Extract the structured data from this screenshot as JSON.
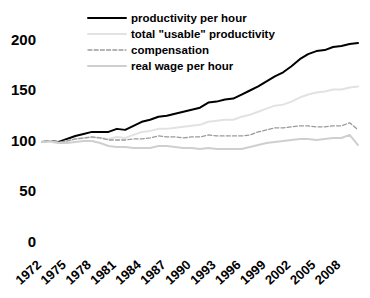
{
  "chart_data": {
    "type": "line",
    "title": "",
    "subtitle": "",
    "xlabel": "",
    "ylabel": "",
    "xlim": [
      1972,
      2010
    ],
    "ylim": [
      0,
      215
    ],
    "grid": false,
    "legend_position": "top-center",
    "y_ticks": [
      "0",
      "50",
      "100",
      "150",
      "200"
    ],
    "y_tick_values": [
      0,
      50,
      100,
      150,
      200
    ],
    "x_ticks": [
      "1972",
      "1975",
      "1978",
      "1981",
      "1984",
      "1987",
      "1990",
      "1993",
      "1996",
      "1999",
      "2002",
      "2005",
      "2008"
    ],
    "x_tick_values": [
      1972,
      1975,
      1978,
      1981,
      1984,
      1987,
      1990,
      1993,
      1996,
      1999,
      2002,
      2005,
      2008
    ],
    "x": [
      1972,
      1973,
      1974,
      1975,
      1976,
      1977,
      1978,
      1979,
      1980,
      1981,
      1982,
      1983,
      1984,
      1985,
      1986,
      1987,
      1988,
      1989,
      1990,
      1991,
      1992,
      1993,
      1994,
      1995,
      1996,
      1997,
      1998,
      1999,
      2000,
      2001,
      2002,
      2003,
      2004,
      2005,
      2006,
      2007,
      2008,
      2009,
      2010
    ],
    "series": [
      {
        "name": "productivity per hour",
        "color": "#000000",
        "style": "solid",
        "width": 2.0,
        "values": [
          100,
          101,
          100,
          103,
          106,
          108,
          110,
          110,
          110,
          113,
          112,
          116,
          120,
          122,
          125,
          126,
          128,
          130,
          132,
          134,
          139,
          140,
          142,
          143,
          147,
          151,
          155,
          160,
          165,
          169,
          175,
          182,
          187,
          190,
          191,
          194,
          195,
          197,
          198
        ]
      },
      {
        "name": "total \"usable\" productivity",
        "color": "#e2e2e2",
        "style": "solid",
        "width": 2.0,
        "values": [
          100,
          100,
          99,
          101,
          103,
          104,
          105,
          104,
          103,
          105,
          104,
          107,
          110,
          111,
          113,
          113,
          114,
          115,
          116,
          117,
          120,
          121,
          122,
          122,
          125,
          127,
          130,
          133,
          136,
          137,
          140,
          144,
          147,
          149,
          150,
          152,
          152,
          154,
          155
        ]
      },
      {
        "name": "compensation",
        "color": "#9a9a9a",
        "style": "dashed",
        "width": 1.3,
        "values": [
          100,
          101,
          100,
          101,
          103,
          104,
          105,
          104,
          102,
          102,
          102,
          103,
          103,
          104,
          106,
          105,
          105,
          104,
          105,
          105,
          107,
          106,
          106,
          106,
          106,
          107,
          110,
          112,
          114,
          114,
          115,
          116,
          116,
          115,
          115,
          116,
          116,
          119,
          112
        ]
      },
      {
        "name": "real wage per hour",
        "color": "#cfcfcf",
        "style": "solid",
        "width": 2.0,
        "values": [
          100,
          101,
          99,
          99,
          100,
          101,
          101,
          99,
          96,
          95,
          95,
          94,
          94,
          94,
          96,
          96,
          95,
          94,
          94,
          93,
          94,
          93,
          93,
          93,
          93,
          95,
          97,
          99,
          100,
          101,
          102,
          103,
          103,
          102,
          103,
          104,
          104,
          107,
          97
        ]
      }
    ],
    "legend": [
      {
        "label": "productivity per hour",
        "color": "#000000",
        "style": "solid"
      },
      {
        "label": "total \"usable\" productivity",
        "color": "#e2e2e2",
        "style": "solid"
      },
      {
        "label": "compensation",
        "color": "#9a9a9a",
        "style": "dashed"
      },
      {
        "label": "real wage per hour",
        "color": "#cfcfcf",
        "style": "solid"
      }
    ]
  }
}
